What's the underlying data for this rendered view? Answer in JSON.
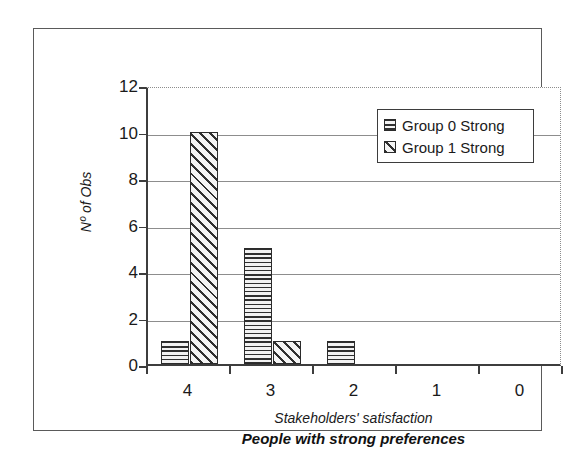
{
  "chart_data": {
    "type": "bar",
    "title": "People with strong preferences",
    "xlabel": "Stakeholders' satisfaction",
    "ylabel": "Nº of Obs",
    "categories": [
      "4",
      "3",
      "2",
      "1",
      "0"
    ],
    "series": [
      {
        "name": "Group 0 Strong",
        "pattern": "horizontal-lines",
        "values": [
          1,
          5,
          1,
          0,
          0
        ]
      },
      {
        "name": "Group 1 Strong",
        "pattern": "diagonal-hatch",
        "values": [
          10,
          1,
          0,
          0,
          0
        ]
      }
    ],
    "ylim": [
      0,
      12
    ],
    "yticks": [
      "0",
      "2",
      "4",
      "6",
      "8",
      "10",
      "12"
    ],
    "ytick_values": [
      0,
      2,
      4,
      6,
      8,
      10,
      12
    ],
    "gridlines": [
      2,
      4,
      6,
      8,
      10
    ],
    "grid": true,
    "legend_position": "top-right",
    "colors": {
      "axis": "#3d3d3d",
      "grid": "#8d8d8d",
      "bar_outline": "#2b2b2b",
      "text": "#1a1a1a",
      "frame": "#5a5a5a",
      "background": "#ffffff"
    }
  },
  "legend": {
    "entries": [
      {
        "label": "Group 0 Strong"
      },
      {
        "label": "Group 1 Strong"
      }
    ]
  }
}
